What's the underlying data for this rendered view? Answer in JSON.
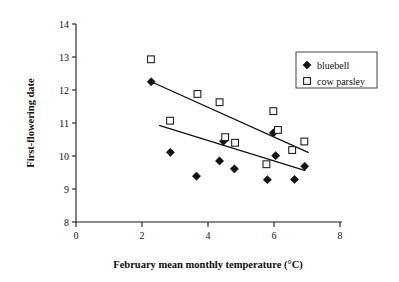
{
  "chart_data": {
    "type": "scatter",
    "title": "",
    "xlabel": "February mean monthly temperature (°C)",
    "ylabel": "First-flowering date",
    "xlim": [
      0,
      8
    ],
    "ylim": [
      8,
      14
    ],
    "xticks": [
      "0",
      "2",
      "4",
      "6",
      "8"
    ],
    "xtick_values": [
      0,
      2,
      4,
      6,
      8
    ],
    "yticks": [
      "8",
      "9",
      "10",
      "11",
      "12",
      "13",
      "14"
    ],
    "ytick_values": [
      8,
      9,
      10,
      11,
      12,
      13,
      14
    ],
    "grid": false,
    "legend_position": "top-right",
    "series": [
      {
        "name": "bluebell",
        "marker": "filled-diamond",
        "color": "#111111",
        "points": [
          {
            "x": 2.28,
            "y": 12.25
          },
          {
            "x": 2.86,
            "y": 10.11
          },
          {
            "x": 3.65,
            "y": 9.39
          },
          {
            "x": 4.35,
            "y": 9.85
          },
          {
            "x": 4.47,
            "y": 10.45
          },
          {
            "x": 4.8,
            "y": 9.61
          },
          {
            "x": 5.8,
            "y": 9.28
          },
          {
            "x": 5.98,
            "y": 10.7
          },
          {
            "x": 6.05,
            "y": 10.01
          },
          {
            "x": 6.62,
            "y": 9.29
          },
          {
            "x": 6.93,
            "y": 9.69
          }
        ],
        "trend_line": {
          "x1": 2.28,
          "y1": 12.25,
          "x2": 7.05,
          "y2": 10.1
        }
      },
      {
        "name": "cow parsley",
        "marker": "open-square",
        "color": "#222222",
        "points": [
          {
            "x": 2.27,
            "y": 12.93
          },
          {
            "x": 2.85,
            "y": 11.07
          },
          {
            "x": 3.68,
            "y": 11.88
          },
          {
            "x": 4.35,
            "y": 11.63
          },
          {
            "x": 4.52,
            "y": 10.57
          },
          {
            "x": 4.82,
            "y": 10.4
          },
          {
            "x": 5.77,
            "y": 9.75
          },
          {
            "x": 5.98,
            "y": 11.36
          },
          {
            "x": 6.12,
            "y": 10.79
          },
          {
            "x": 6.55,
            "y": 10.18
          },
          {
            "x": 6.92,
            "y": 10.44
          }
        ],
        "trend_line": {
          "x1": 2.52,
          "y1": 10.93,
          "x2": 6.95,
          "y2": 9.56
        }
      }
    ]
  },
  "legend": {
    "entries": [
      {
        "label": "bluebell",
        "marker": "filled-diamond"
      },
      {
        "label": "cow parsley",
        "marker": "open-square"
      }
    ]
  }
}
